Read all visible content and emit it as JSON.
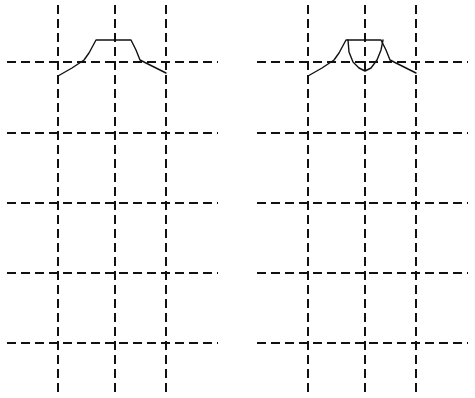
{
  "diagram": {
    "canvas": {
      "width": 475,
      "height": 398,
      "background": "#ffffff"
    },
    "stroke_color": "#111111",
    "panels": [
      {
        "id": "left",
        "description": "Dashed grid with a trapezoidal bump curve",
        "vertical_lines_x": [
          58,
          115,
          166
        ],
        "vertical_span_y": [
          5,
          393
        ],
        "horizontal_lines_y": [
          62,
          133,
          203,
          273,
          343
        ],
        "horizontal_span_x": [
          7,
          218
        ],
        "curves": [
          {
            "name": "outer-bump",
            "points": [
              [
                58,
                76
              ],
              [
                72,
                68
              ],
              [
                84,
                60
              ],
              [
                89,
                53
              ],
              [
                96,
                40
              ],
              [
                131,
                40
              ],
              [
                136,
                50
              ],
              [
                140,
                60
              ],
              [
                152,
                66
              ],
              [
                166,
                73
              ]
            ]
          }
        ]
      },
      {
        "id": "right",
        "description": "Dashed grid with a trapezoidal bump curve plus inner U-shaped dip",
        "vertical_lines_x": [
          308,
          365,
          416
        ],
        "vertical_span_y": [
          5,
          393
        ],
        "horizontal_lines_y": [
          62,
          133,
          203,
          273,
          343
        ],
        "horizontal_span_x": [
          257,
          468
        ],
        "curves": [
          {
            "name": "outer-bump",
            "points": [
              [
                308,
                76
              ],
              [
                322,
                68
              ],
              [
                334,
                60
              ],
              [
                339,
                53
              ],
              [
                346,
                40
              ],
              [
                381,
                40
              ],
              [
                386,
                50
              ],
              [
                390,
                60
              ],
              [
                402,
                66
              ],
              [
                416,
                73
              ]
            ]
          },
          {
            "name": "inner-dip",
            "points": [
              [
                348,
                40
              ],
              [
                349,
                52
              ],
              [
                353,
                62
              ],
              [
                359,
                68
              ],
              [
                365,
                71
              ],
              [
                371,
                68
              ],
              [
                377,
                60
              ],
              [
                381,
                50
              ],
              [
                383,
                40
              ]
            ]
          }
        ]
      }
    ]
  }
}
